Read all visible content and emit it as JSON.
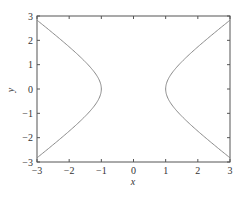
{
  "chart_data": {
    "type": "line",
    "title": "",
    "xlabel": "x",
    "ylabel": "y",
    "xlim": [
      -3,
      3
    ],
    "ylim": [
      -3,
      3
    ],
    "xticks": [
      -3,
      -2,
      -1,
      0,
      1,
      2,
      3
    ],
    "yticks": [
      -3,
      -2,
      -1,
      0,
      1,
      2,
      3
    ],
    "xtick_labels": [
      "−3",
      "−2",
      "−1",
      "0",
      "1",
      "2",
      "3"
    ],
    "ytick_labels": [
      "−3",
      "−2",
      "−1",
      "0",
      "1",
      "2",
      "3"
    ],
    "grid": false,
    "legend": null,
    "series": [
      {
        "name": "left branch (x^2 - y^2 = 1)",
        "x": [
          -3.0,
          -2.5,
          -2.0,
          -1.6,
          -1.3,
          -1.1,
          -1.0,
          -1.1,
          -1.3,
          -1.6,
          -2.0,
          -2.5,
          -3.0
        ],
        "y": [
          2.83,
          2.29,
          1.73,
          1.25,
          0.83,
          0.46,
          0.0,
          -0.46,
          -0.83,
          -1.25,
          -1.73,
          -2.29,
          -2.83
        ]
      },
      {
        "name": "right branch (x^2 - y^2 = 1)",
        "x": [
          3.0,
          2.5,
          2.0,
          1.6,
          1.3,
          1.1,
          1.0,
          1.1,
          1.3,
          1.6,
          2.0,
          2.5,
          3.0
        ],
        "y": [
          2.83,
          2.29,
          1.73,
          1.25,
          0.83,
          0.46,
          0.0,
          -0.46,
          -0.83,
          -1.25,
          -1.73,
          -2.29,
          -2.83
        ]
      }
    ],
    "colors": {
      "line": "#8a8a8a",
      "axes": "#555555"
    }
  }
}
